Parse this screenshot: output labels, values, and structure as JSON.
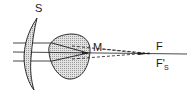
{
  "diagram": {
    "title": "",
    "labels": {
      "lens": "S",
      "convergence_point": "M",
      "focus": "F",
      "shifted_focus_main": "F'",
      "shifted_focus_sub": "S"
    },
    "elements": [
      {
        "id": "lens-s",
        "kind": "crescent lens (hatched)"
      },
      {
        "id": "eye-globe",
        "kind": "drop-shaped globe (shaded)"
      },
      {
        "id": "incident-rays",
        "kind": "three parallel horizontal rays",
        "count": 3
      },
      {
        "id": "refracted-rays",
        "kind": "rays converging inside the globe at M"
      },
      {
        "id": "extended-rays",
        "kind": "dashed extensions to F"
      },
      {
        "id": "optical-axis",
        "kind": "solid horizontal axis"
      }
    ],
    "colors": {
      "stroke": "#1a1a1a",
      "fill_shade": "#cfcfcf",
      "background": "#ffffff"
    }
  }
}
